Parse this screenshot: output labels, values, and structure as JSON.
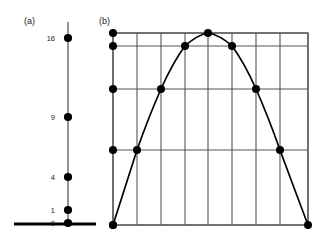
{
  "figure": {
    "width": 322,
    "height": 243,
    "background": "#ffffff",
    "ink_color": "#000000",
    "grid_color": "#555555"
  },
  "panel_a": {
    "label": "(a)",
    "label_x": 24,
    "label_y": 24,
    "axis_x": 68,
    "axis_top_y": 22,
    "axis_bottom_y": 224,
    "baseline": {
      "x1": 14,
      "x2": 96,
      "y": 224
    },
    "tick_label_x": 55,
    "values": [
      16,
      9,
      4,
      1,
      0
    ],
    "points": [
      {
        "label": "16",
        "value": 16,
        "y": 38
      },
      {
        "label": "9",
        "value": 9,
        "y": 117
      },
      {
        "label": "4",
        "value": 4,
        "y": 177
      },
      {
        "label": "1",
        "value": 1,
        "y": 210
      },
      {
        "label": "0",
        "value": 0,
        "y": 223
      }
    ]
  },
  "panel_b": {
    "label": "(b)",
    "label_x": 99,
    "label_y": 24,
    "plot": {
      "left": 113,
      "right": 308,
      "top": 33,
      "bottom": 225
    },
    "vertical_grid_x": [
      113,
      137,
      161,
      185,
      208,
      232,
      256,
      280,
      308
    ],
    "horizontal_grid_y": [
      33,
      46,
      89,
      150,
      225
    ],
    "horizontal_grid_values": [
      16,
      15,
      12,
      7,
      0
    ],
    "curve_points": [
      {
        "x": 113,
        "y": 225,
        "value": 0,
        "marked": true
      },
      {
        "x": 137,
        "y": 150,
        "value": 7,
        "marked": true
      },
      {
        "x": 161,
        "y": 89,
        "value": 12,
        "marked": true
      },
      {
        "x": 185,
        "y": 46,
        "value": 15,
        "marked": true
      },
      {
        "x": 208,
        "y": 33,
        "value": 16,
        "marked": true
      },
      {
        "x": 232,
        "y": 46,
        "value": 15,
        "marked": true
      },
      {
        "x": 256,
        "y": 89,
        "value": 12,
        "marked": true
      },
      {
        "x": 280,
        "y": 150,
        "value": 7,
        "marked": true
      },
      {
        "x": 308,
        "y": 225,
        "value": 0,
        "marked": true
      }
    ],
    "edge_marker_points": [
      {
        "x": 113,
        "y": 33,
        "value": 16
      },
      {
        "x": 113,
        "y": 46,
        "value": 15
      },
      {
        "x": 113,
        "y": 89,
        "value": 12
      },
      {
        "x": 113,
        "y": 150,
        "value": 7
      },
      {
        "x": 113,
        "y": 225,
        "value": 0
      }
    ],
    "curve_path": "M 113 225 Q 125 188 137 150 Q 149 116 161 89 Q 173 62 185 46 Q 197 35 208 33 Q 220 35 232 46 Q 244 62 256 89 Q 268 116 280 150 Q 294 188 308 225"
  },
  "chart_data": {
    "type": "scatter",
    "title": "",
    "subtitle": "",
    "xlabel": "",
    "ylabel": "",
    "panels": [
      {
        "key": "a",
        "label": "(a)",
        "type": "scatter",
        "orientation": "vertical-number-line",
        "description": "Vertical number line showing the perfect squares marked as points",
        "tick_labels": [
          "16",
          "9",
          "4",
          "1",
          "0"
        ],
        "values": [
          16,
          9,
          4,
          1,
          0
        ],
        "ylim": [
          0,
          16
        ],
        "grid": false,
        "legend": "none"
      },
      {
        "key": "b",
        "label": "(b)",
        "type": "line",
        "description": "Downward-opening parabola plotted on a rectangular grid with marked lattice points",
        "x": [
          0,
          1,
          2,
          3,
          4,
          5,
          6,
          7,
          8
        ],
        "values": [
          0,
          7,
          12,
          15,
          16,
          15,
          12,
          7,
          0
        ],
        "xlim": [
          0,
          8
        ],
        "ylim": [
          0,
          16
        ],
        "y_gridlines": [
          0,
          7,
          12,
          15,
          16
        ],
        "x_gridlines": [
          0,
          1,
          2,
          3,
          4,
          5,
          6,
          7,
          8
        ],
        "grid": true,
        "legend": "none"
      }
    ]
  }
}
